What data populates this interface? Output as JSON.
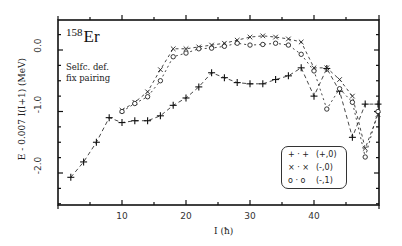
{
  "chart_data": {
    "type": "line",
    "title": "158Er",
    "nucleus": {
      "mass": "158",
      "element": "Er"
    },
    "annotation": [
      "Selfc. def.",
      "fix pairing"
    ],
    "xlabel": "I (ħ)",
    "ylabel": "E - 0.007 I(I+1)  (MeV)",
    "xlim": [
      0,
      50
    ],
    "ylim": [
      -2.5,
      0.5
    ],
    "xticks": [
      10,
      20,
      30,
      40
    ],
    "yticks": [
      "0.0",
      "-1.0",
      "-2.0"
    ],
    "ytick_values": [
      0.0,
      -1.0,
      -2.0
    ],
    "grid": false,
    "legend_position": "lower right",
    "series": [
      {
        "name": "(+,0)",
        "marker": "+",
        "legend_symbol": "+ · +",
        "x": [
          2,
          4,
          6,
          8,
          10,
          12,
          14,
          16,
          18,
          20,
          22,
          24,
          26,
          28,
          30,
          32,
          34,
          36,
          38,
          40,
          42,
          44,
          46,
          48,
          50
        ],
        "y": [
          -2.07,
          -1.82,
          -1.5,
          -1.1,
          -1.18,
          -1.15,
          -1.15,
          -1.07,
          -0.9,
          -0.78,
          -0.6,
          -0.37,
          -0.45,
          -0.53,
          -0.55,
          -0.55,
          -0.48,
          -0.42,
          -0.29,
          -0.75,
          -0.3,
          -0.67,
          -1.42,
          -0.88,
          -0.88
        ]
      },
      {
        "name": "(-,0)",
        "marker": "x",
        "legend_symbol": "× · ×",
        "x": [
          10,
          12,
          14,
          16,
          18,
          20,
          22,
          24,
          26,
          28,
          30,
          32,
          34,
          36,
          38,
          40,
          42,
          44,
          46,
          48,
          50
        ],
        "y": [
          -0.98,
          -0.85,
          -0.68,
          -0.32,
          0.02,
          0.02,
          0.05,
          0.08,
          0.11,
          0.16,
          0.21,
          0.23,
          0.21,
          0.18,
          0.13,
          -0.29,
          -0.29,
          -0.48,
          -0.75,
          -1.6,
          -1.05
        ]
      },
      {
        "name": "(-,1)",
        "marker": "o",
        "legend_symbol": "o · o",
        "x": [
          10,
          12,
          14,
          16,
          18,
          20,
          22,
          24,
          26,
          28,
          30,
          32,
          34,
          36,
          38,
          40,
          42,
          44,
          46,
          48,
          50
        ],
        "y": [
          -1.0,
          -0.87,
          -0.76,
          -0.5,
          -0.11,
          -0.05,
          0.02,
          0.03,
          0.06,
          0.11,
          0.08,
          0.09,
          0.11,
          0.08,
          -0.07,
          -0.34,
          -0.96,
          -0.63,
          -0.85,
          -1.74,
          -1.0
        ]
      }
    ]
  },
  "frame": {
    "left": 58,
    "right": 379,
    "top": 20,
    "bottom": 205,
    "x0": 58,
    "xscale": 6.4,
    "y0": 50,
    "yscale": 61.5
  }
}
